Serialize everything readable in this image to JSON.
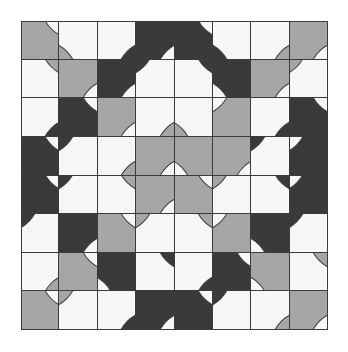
{
  "artwork": {
    "title": "Truchet Quarter-Circle Tiling",
    "type": "tile-pattern",
    "grid_rows": 8,
    "grid_cols": 8,
    "canvas_width": 348,
    "canvas_height": 352,
    "grid_origin_x": 21,
    "grid_origin_y": 21,
    "grid_width": 307,
    "grid_height": 309,
    "background_color": "#ffffff",
    "line_color": "#3b3b3b",
    "palette": {
      "white": "#f7f7f5",
      "gray": "#a6a6a6",
      "dark": "#3a3a3a"
    },
    "tiles": [
      [
        {
          "base": "gray",
          "disc": "white",
          "corner": "tr"
        },
        {
          "base": "white",
          "disc": "gray",
          "corner": "bl"
        },
        {
          "base": "white",
          "disc": "dark",
          "corner": "br"
        },
        {
          "base": "dark",
          "disc": "white",
          "corner": "br"
        },
        {
          "base": "dark",
          "disc": "white",
          "corner": "tr"
        },
        {
          "base": "white",
          "disc": "dark",
          "corner": "bl"
        },
        {
          "base": "white",
          "disc": "gray",
          "corner": "br"
        },
        {
          "base": "gray",
          "disc": "white",
          "corner": "br"
        }
      ],
      [
        {
          "base": "white",
          "disc": "gray",
          "corner": "tr"
        },
        {
          "base": "gray",
          "disc": "white",
          "corner": "br"
        },
        {
          "base": "dark",
          "disc": "white",
          "corner": "br"
        },
        {
          "base": "white",
          "disc": "dark",
          "corner": "tl"
        },
        {
          "base": "white",
          "disc": "dark",
          "corner": "tr"
        },
        {
          "base": "dark",
          "disc": "white",
          "corner": "bl"
        },
        {
          "base": "gray",
          "disc": "white",
          "corner": "br"
        },
        {
          "base": "white",
          "disc": "gray",
          "corner": "tl"
        }
      ],
      [
        {
          "base": "white",
          "disc": "dark",
          "corner": "br"
        },
        {
          "base": "dark",
          "disc": "white",
          "corner": "tr"
        },
        {
          "base": "gray",
          "disc": "white",
          "corner": "br"
        },
        {
          "base": "white",
          "disc": "gray",
          "corner": "br"
        },
        {
          "base": "white",
          "disc": "gray",
          "corner": "bl"
        },
        {
          "base": "gray",
          "disc": "white",
          "corner": "tl"
        },
        {
          "base": "white",
          "disc": "dark",
          "corner": "br"
        },
        {
          "base": "dark",
          "disc": "white",
          "corner": "tr"
        }
      ],
      [
        {
          "base": "dark",
          "disc": "white",
          "corner": "tr"
        },
        {
          "base": "white",
          "disc": "dark",
          "corner": "tl"
        },
        {
          "base": "white",
          "disc": "gray",
          "corner": "br"
        },
        {
          "base": "gray",
          "disc": "white",
          "corner": "br"
        },
        {
          "base": "gray",
          "disc": "white",
          "corner": "bl"
        },
        {
          "base": "gray",
          "disc": "white",
          "corner": "br"
        },
        {
          "base": "white",
          "disc": "dark",
          "corner": "tl"
        },
        {
          "base": "dark",
          "disc": "white",
          "corner": "tl"
        }
      ],
      [
        {
          "base": "dark",
          "disc": "white",
          "corner": "tr"
        },
        {
          "base": "white",
          "disc": "dark",
          "corner": "tl"
        },
        {
          "base": "white",
          "disc": "gray",
          "corner": "tr"
        },
        {
          "base": "gray",
          "disc": "white",
          "corner": "br"
        },
        {
          "base": "gray",
          "disc": "white",
          "corner": "tr"
        },
        {
          "base": "white",
          "disc": "gray",
          "corner": "tl"
        },
        {
          "base": "white",
          "disc": "dark",
          "corner": "tr"
        },
        {
          "base": "dark",
          "disc": "white",
          "corner": "tl"
        }
      ],
      [
        {
          "base": "white",
          "disc": "dark",
          "corner": "tl"
        },
        {
          "base": "dark",
          "disc": "white",
          "corner": "br"
        },
        {
          "base": "gray",
          "disc": "white",
          "corner": "tr"
        },
        {
          "base": "white",
          "disc": "gray",
          "corner": "tl"
        },
        {
          "base": "white",
          "disc": "gray",
          "corner": "tr"
        },
        {
          "base": "gray",
          "disc": "white",
          "corner": "tl"
        },
        {
          "base": "dark",
          "disc": "white",
          "corner": "bl"
        },
        {
          "base": "white",
          "disc": "dark",
          "corner": "tl"
        }
      ],
      [
        {
          "base": "white",
          "disc": "gray",
          "corner": "br"
        },
        {
          "base": "gray",
          "disc": "white",
          "corner": "tr"
        },
        {
          "base": "dark",
          "disc": "white",
          "corner": "bl"
        },
        {
          "base": "white",
          "disc": "dark",
          "corner": "tr"
        },
        {
          "base": "white",
          "disc": "dark",
          "corner": "br"
        },
        {
          "base": "dark",
          "disc": "white",
          "corner": "tr"
        },
        {
          "base": "gray",
          "disc": "white",
          "corner": "bl"
        },
        {
          "base": "white",
          "disc": "gray",
          "corner": "tr"
        }
      ],
      [
        {
          "base": "gray",
          "disc": "white",
          "corner": "tr"
        },
        {
          "base": "white",
          "disc": "gray",
          "corner": "tl"
        },
        {
          "base": "white",
          "disc": "dark",
          "corner": "br"
        },
        {
          "base": "dark",
          "disc": "white",
          "corner": "br"
        },
        {
          "base": "dark",
          "disc": "white",
          "corner": "tr"
        },
        {
          "base": "white",
          "disc": "dark",
          "corner": "tl"
        },
        {
          "base": "white",
          "disc": "gray",
          "corner": "br"
        },
        {
          "base": "gray",
          "disc": "white",
          "corner": "br"
        }
      ]
    ]
  }
}
